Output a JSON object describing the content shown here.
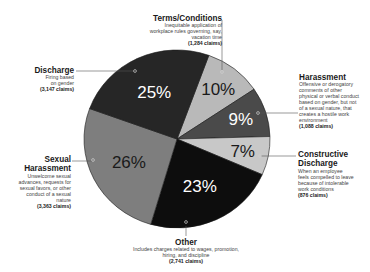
{
  "chart_data": {
    "type": "pie",
    "title": "",
    "start_angle_deg": 20,
    "direction": "clockwise",
    "slices": [
      {
        "label": "Terms/Conditions",
        "percent": 10,
        "claims": "1,284 claims",
        "description": "Inequitable application of workplace rules governing, say, vacation time",
        "color": "#b9b9b9",
        "text_color": "#1a1a1a"
      },
      {
        "label": "Harassment",
        "percent": 9,
        "claims": "1,088 claims",
        "description": "Offensive or derogatory comments of other physical or verbal conduct based on gender, but not of a sexual nature, that creates a hostile work environment",
        "color": "#4a4a4a",
        "text_color": "#ffffff"
      },
      {
        "label": "Constructive Discharge",
        "percent": 7,
        "claims": "876 claims",
        "description": "When an employee feels compelled to leave because of intolerable work conditions",
        "color": "#c8c8c8",
        "text_color": "#1a1a1a"
      },
      {
        "label": "Other",
        "percent": 23,
        "claims": "2,741 claims",
        "description": "Includes charges related to wages, promotion, hiring, and discipline",
        "color": "#0d0d0d",
        "text_color": "#ffffff"
      },
      {
        "label": "Sexual Harassment",
        "percent": 26,
        "claims": "3,363 claims",
        "description": "Unwelcome sexual advances, requests for sexual favors, or other conduct of a sexual nature",
        "color": "#7e7e7e",
        "text_color": "#1a1a1a"
      },
      {
        "label": "Discharge",
        "percent": 25,
        "claims": "3,147 claims",
        "description": "Firing based on gender",
        "color": "#262626",
        "text_color": "#ffffff"
      }
    ],
    "legend_position": "callouts"
  },
  "labels": {
    "terms": {
      "title": "Terms/Conditions",
      "desc": "Inequitable application of workplace rules governing, say, vacation time",
      "claims": "(1,284 claims)"
    },
    "harassment": {
      "title": "Harassment",
      "desc": "Offensive or derogatory comments of other physical or verbal conduct based on gender, but not of a sexual nature, that creates a hostile work environment",
      "claims": "(1,088 claims)"
    },
    "constructive": {
      "title": "Constructive Discharge",
      "desc": "When an employee feels compelled to leave because of intolerable work conditions",
      "claims": "(876 claims)"
    },
    "other": {
      "title": "Other",
      "desc": "Includes charges related to wages, promotion, hiring, and discipline",
      "claims": "(2,741 claims)"
    },
    "sexual": {
      "title": "Sexual Harassment",
      "desc": "Unwelcome sexual advances, requests for sexual favors, or other conduct of a sexual nature",
      "claims": "(3,363 claims)"
    },
    "discharge": {
      "title": "Discharge",
      "desc": "Firing based on gender",
      "claims": "(3,147 claims)"
    }
  }
}
